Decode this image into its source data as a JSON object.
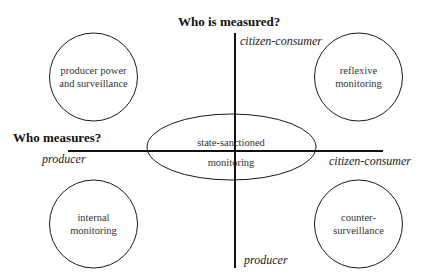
{
  "diagram": {
    "vertical_axis": {
      "title": "Who is measured?",
      "top_label": "citizen-consumer",
      "bottom_label": "producer"
    },
    "horizontal_axis": {
      "title": "Who measures?",
      "left_label": "producer",
      "right_label": "citizen-consumer"
    },
    "nodes": [
      {
        "id": "top-left",
        "line1": "producer power",
        "line2": "and surveillance"
      },
      {
        "id": "top-right",
        "line1": "reflexive",
        "line2": "monitoring"
      },
      {
        "id": "bottom-left",
        "line1": "internal",
        "line2": "monitoring"
      },
      {
        "id": "bottom-right",
        "line1": "counter-",
        "line2": "surveillance"
      },
      {
        "id": "center",
        "line1": "state-sanctioned",
        "line2": "monitoring"
      }
    ],
    "colors": {
      "line": "#1a1a1a",
      "text": "#333333",
      "background": "#ffffff"
    }
  }
}
